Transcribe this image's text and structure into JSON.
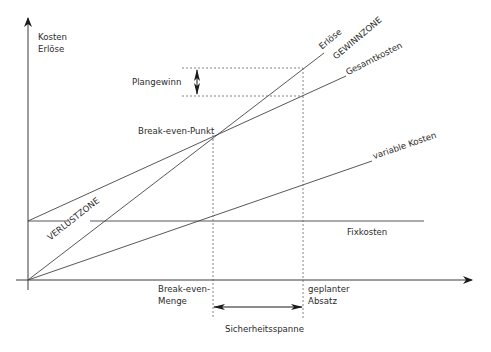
{
  "diagram": {
    "axes": {
      "y_label_line1": "Kosten",
      "y_label_line2": "Erlöse"
    },
    "lines": {
      "revenue": "Erlöse",
      "total_costs": "Gesamtkosten",
      "variable_costs": "variable Kosten",
      "fixed_costs": "Fixkosten"
    },
    "zones": {
      "profit": "GEWINNZONE",
      "loss": "VERLUSTZONE"
    },
    "points": {
      "break_even_point": "Break-even-Punkt",
      "planned_profit": "Plangewinn",
      "break_even_quantity_line1": "Break-even-",
      "break_even_quantity_line2": "Menge",
      "planned_sales_line1": "geplanter",
      "planned_sales_line2": "Absatz",
      "safety_margin": "Sicherheitsspanne"
    },
    "colors": {
      "line": "#3a3a3a",
      "text": "#2b2b2b",
      "background": "#ffffff"
    }
  }
}
